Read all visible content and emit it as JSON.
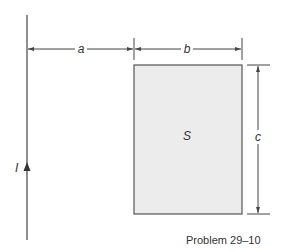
{
  "diagram": {
    "wire_label": "I",
    "dim_a": "a",
    "dim_b": "b",
    "dim_c": "c",
    "surface_label": "S",
    "caption": "Problem 29–10",
    "colors": {
      "line": "#444444",
      "rect_fill": "#ececec",
      "rect_stroke": "#555555"
    }
  }
}
